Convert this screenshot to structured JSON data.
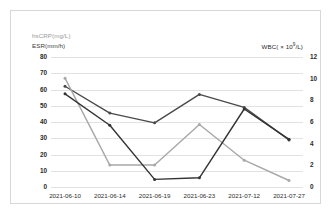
{
  "chart_data": {
    "type": "line",
    "title": "",
    "xlabel": "",
    "categories": [
      "2021-06-10",
      "2021-06-14",
      "2021-06-19",
      "2021-06-23",
      "2021-07-12",
      "2021-07-27"
    ],
    "grid": true,
    "legend_position": "none",
    "axes": {
      "left": {
        "label_line1": "hsCRP(mg/L)",
        "label_line2": "ESR(mm/h)",
        "ylim": [
          0,
          80
        ],
        "ticks": [
          80,
          70,
          60,
          50,
          40,
          30,
          20,
          10,
          0
        ]
      },
      "right": {
        "label": "WBC( × 10",
        "label_sup": "9",
        "label_tail": "/L)",
        "ylim": [
          0,
          12
        ],
        "ticks": [
          12,
          10,
          8,
          6,
          4,
          2,
          0
        ]
      }
    },
    "series": [
      {
        "name": "ESR(mm/h)",
        "axis": "left",
        "color": "#4a4a4a",
        "values": [
          62,
          45.5,
          39.5,
          57,
          49,
          29
        ]
      },
      {
        "name": "hsCRP(mg/L)",
        "axis": "left",
        "color": "#a8a8a8",
        "values": [
          67,
          13.5,
          13.5,
          38.5,
          16.5,
          4
        ]
      },
      {
        "name": "WBC( × 10^9/L)",
        "axis": "right",
        "color": "#333333",
        "values": [
          8.6,
          5.7,
          0.7,
          0.85,
          7.2,
          4.4
        ]
      }
    ]
  }
}
